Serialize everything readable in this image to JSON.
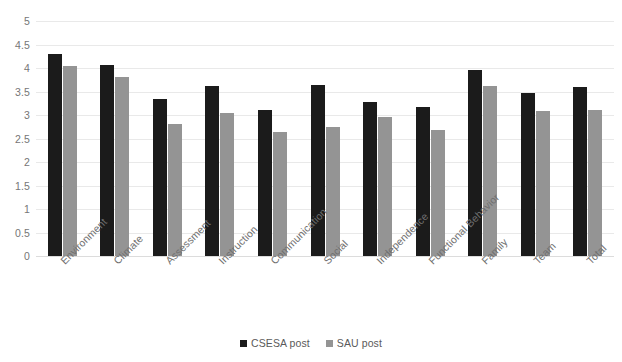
{
  "chart_data": {
    "type": "bar",
    "title": "",
    "subtitle": "",
    "xlabel": "",
    "ylabel": "",
    "ylim": [
      0,
      5
    ],
    "ytick_step": 0.5,
    "yticks": [
      "5",
      "4.5",
      "4",
      "3.5",
      "3",
      "2.5",
      "2",
      "1.5",
      "1",
      "0.5",
      "0"
    ],
    "grid": true,
    "legend_position": "bottom",
    "categories": [
      "Environment",
      "Climate",
      "Assessment",
      "Instruction",
      "Communication",
      "Social",
      "Independence",
      "Functional Behavior",
      "Family",
      "Team",
      "Total"
    ],
    "series": [
      {
        "name": "CSESA post",
        "color": "#1b1b1b",
        "values": [
          4.3,
          4.07,
          3.35,
          3.62,
          3.1,
          3.63,
          3.27,
          3.17,
          3.95,
          3.47,
          3.6
        ]
      },
      {
        "name": "SAU post",
        "color": "#949494",
        "values": [
          4.05,
          3.8,
          2.8,
          3.05,
          2.63,
          2.75,
          2.95,
          2.68,
          3.62,
          3.08,
          3.1
        ]
      }
    ]
  },
  "legend": {
    "items": [
      {
        "label": "CSESA post",
        "color": "#1b1b1b"
      },
      {
        "label": "SAU post",
        "color": "#949494"
      }
    ]
  }
}
